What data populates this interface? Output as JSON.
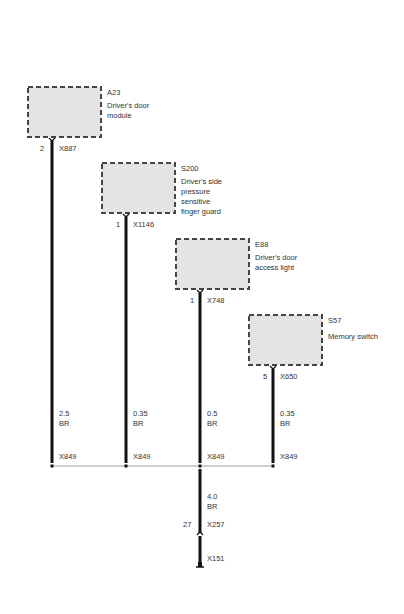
{
  "components": [
    {
      "id": "A23",
      "name": "Driver's door module",
      "lines": [
        "Driver's door",
        "module"
      ],
      "pin": "2",
      "connector": "X887",
      "wire_size": "2.5",
      "wire_color": "BR",
      "bus_connector": "X849"
    },
    {
      "id": "S200",
      "name": "Driver's side pressure sensitive finger guard",
      "lines": [
        "Driver's side",
        "pressure",
        "sensitive",
        "finger guard"
      ],
      "pin": "1",
      "connector": "X1146",
      "wire_size": "0.35",
      "wire_color": "BR",
      "bus_connector": "X849"
    },
    {
      "id": "E88",
      "name": "Driver's door access light",
      "lines": [
        "Driver's door",
        "access light"
      ],
      "pin": "1",
      "connector": "X748",
      "wire_size": "0.5",
      "wire_color": "BR",
      "bus_connector": "X849"
    },
    {
      "id": "S57",
      "name": "Memory switch",
      "lines": [
        "Memory switch"
      ],
      "pin": "5",
      "connector": "X650",
      "wire_size": "0.35",
      "wire_color": "BR",
      "bus_connector": "X849"
    }
  ],
  "trunk": {
    "wire_size": "4.0",
    "wire_color": "BR",
    "pin": "27",
    "connector": "X257",
    "ground_connector": "X151"
  }
}
